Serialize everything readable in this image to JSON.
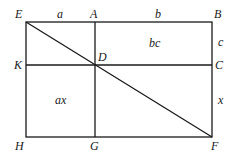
{
  "diagram": {
    "points": {
      "E": {
        "label": "E",
        "x": 26,
        "y": 22
      },
      "A": {
        "label": "A",
        "x": 95,
        "y": 22
      },
      "B": {
        "label": "B",
        "x": 212,
        "y": 22
      },
      "K": {
        "label": "K",
        "x": 26,
        "y": 65
      },
      "D": {
        "label": "D",
        "x": 95,
        "y": 65
      },
      "C": {
        "label": "C",
        "x": 212,
        "y": 65
      },
      "H": {
        "label": "H",
        "x": 26,
        "y": 137
      },
      "G": {
        "label": "G",
        "x": 95,
        "y": 137
      },
      "F": {
        "label": "F",
        "x": 212,
        "y": 137
      }
    },
    "segment_labels": {
      "a": "a",
      "b": "b",
      "c": "c",
      "x": "x"
    },
    "region_labels": {
      "bc": "bc",
      "ax": "ax"
    },
    "colors": {
      "line": "#1a1a1a",
      "background": "#ffffff"
    }
  }
}
